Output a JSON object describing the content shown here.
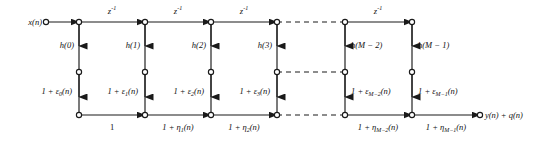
{
  "diagram": {
    "input_label": "x(n)",
    "output_label": "y(n) + q(n)",
    "delay_label": "z",
    "delay_exponent": "-1",
    "delays": [
      {
        "label": "z",
        "exp": "-1",
        "x": 112
      },
      {
        "label": "z",
        "exp": "-1",
        "x": 178
      },
      {
        "label": "z",
        "exp": "-1",
        "x": 244
      },
      {
        "label": "z",
        "exp": "-1",
        "x": 378
      }
    ],
    "taps": [
      {
        "name": "h(0)",
        "x": 79
      },
      {
        "name": "h(1)",
        "x": 145
      },
      {
        "name": "h(2)",
        "x": 211
      },
      {
        "name": "h(3)",
        "x": 277
      },
      {
        "name": "h(M − 2)",
        "x": 345
      },
      {
        "name": "h(M − 1)",
        "x": 412
      }
    ],
    "gain_labels": [
      {
        "text": "1 + ε",
        "sub": "0",
        "tail": "(n)",
        "x": 79,
        "side": "left"
      },
      {
        "text": "1 + ε",
        "sub": "1",
        "tail": "(n)",
        "x": 145,
        "side": "left"
      },
      {
        "text": "1 + ε",
        "sub": "2",
        "tail": "(n)",
        "x": 211,
        "side": "left"
      },
      {
        "text": "1 + ε",
        "sub": "3",
        "tail": "(n)",
        "x": 277,
        "side": "left"
      },
      {
        "text": "1 + ε",
        "sub": "M−2",
        "tail": "(n)",
        "x": 345,
        "side": "right"
      },
      {
        "text": "1 + ε",
        "sub": "M−1",
        "tail": "(n)",
        "x": 412,
        "side": "right"
      }
    ],
    "sum_labels": [
      {
        "text": "1",
        "sub": "",
        "tail": "",
        "x": 112
      },
      {
        "text": "1 + η",
        "sub": "1",
        "tail": "(n)",
        "x": 178
      },
      {
        "text": "1 + η",
        "sub": "2",
        "tail": "(n)",
        "x": 244
      },
      {
        "text": "1 + η",
        "sub": "M−2",
        "tail": "(n)",
        "x": 378
      },
      {
        "text": "1 + η",
        "sub": "M−1",
        "tail": "(n)",
        "x": 446
      }
    ],
    "colors": {
      "line": "#1a1a1a",
      "text": "#111111",
      "background": "#ffffff"
    }
  }
}
